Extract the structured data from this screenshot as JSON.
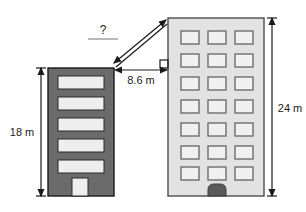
{
  "figure": {
    "type": "geometry-diagram",
    "labels": {
      "unknown": "?",
      "horizontal_distance": "8.6 m",
      "left_building_height": "18 m",
      "right_building_height": "24 m"
    },
    "colors": {
      "left_building_fill": "#6b6b6b",
      "left_building_stroke": "#1a1a1a",
      "left_window_fill": "#eeeeee",
      "right_building_fill": "#e2e2e2",
      "right_building_stroke": "#4d4d4d",
      "right_window_fill": "#f0f0f0",
      "right_window_stroke": "#6e6e6e",
      "right_door_fill": "#5a5a5a",
      "line": "#1a1a1a",
      "background": "#ffffff"
    },
    "left_building": {
      "name": "left-building",
      "height_label": "18 m",
      "window_rows": 5,
      "window_columns": 1,
      "has_door": true,
      "door_style": "light-rectangle"
    },
    "right_building": {
      "name": "right-building",
      "height_label": "24 m",
      "window_rows": 7,
      "window_columns": 3,
      "has_door": true,
      "door_style": "dark-rounded"
    },
    "measurements": [
      {
        "name": "diagonal-distance",
        "label": "?",
        "kind": "double-headed-arrow",
        "from": "top-right corner of left building",
        "to": "top-left corner of right building"
      },
      {
        "name": "horizontal-gap",
        "label": "8.6 m",
        "kind": "double-headed-arrow",
        "from": "right edge of left building",
        "to": "left edge of right building"
      },
      {
        "name": "left-height",
        "label": "18 m",
        "kind": "vertical-dimension-line"
      },
      {
        "name": "right-height",
        "label": "24 m",
        "kind": "vertical-dimension-line"
      }
    ],
    "right_angle_marker": {
      "name": "right-angle-marker",
      "present": true
    }
  }
}
